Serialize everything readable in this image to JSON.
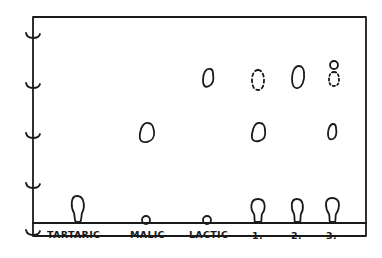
{
  "diagram": {
    "title": "",
    "type": "paper chromatogram (hand-drawn)",
    "ink_color": "#1a1a1a",
    "background": "#ffffff",
    "lanes": [
      {
        "label": "TARTARIC",
        "x": 77,
        "spots": [
          {
            "shape": "keyhole",
            "y": 210,
            "style": "solid"
          }
        ]
      },
      {
        "label": "MALIC",
        "x": 146,
        "spots": [
          {
            "shape": "oval",
            "y": 132,
            "style": "solid"
          }
        ]
      },
      {
        "label": "LACTIC",
        "x": 207,
        "spots": [
          {
            "shape": "oval",
            "y": 78,
            "style": "solid"
          }
        ]
      },
      {
        "label": "1.",
        "x": 258,
        "spots": [
          {
            "shape": "keyhole",
            "y": 210,
            "style": "solid"
          },
          {
            "shape": "oval",
            "y": 132,
            "style": "solid"
          },
          {
            "shape": "oval",
            "y": 80,
            "style": "dotted"
          }
        ]
      },
      {
        "label": "2.",
        "x": 297,
        "spots": [
          {
            "shape": "keyhole",
            "y": 210,
            "style": "solid"
          },
          {
            "shape": "oval",
            "y": 77,
            "style": "solid"
          }
        ]
      },
      {
        "label": "3.",
        "x": 332,
        "spots": [
          {
            "shape": "keyhole",
            "y": 210,
            "style": "solid"
          },
          {
            "shape": "oval",
            "y": 131,
            "style": "solid"
          },
          {
            "shape": "circle",
            "y": 66,
            "style": "solid"
          },
          {
            "shape": "oval",
            "y": 78,
            "style": "dotted"
          }
        ]
      }
    ],
    "axis_ticks": 5
  }
}
